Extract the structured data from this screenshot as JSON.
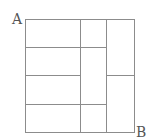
{
  "diagram": {
    "type": "grid-path",
    "labels": {
      "start": "A",
      "end": "B"
    },
    "colors": {
      "line": "#8c8c8c",
      "label": "#555555",
      "background": "#ffffff"
    },
    "outer_rect": {
      "x1": 25.5,
      "y1": 19.5,
      "x2": 134.5,
      "y2": 132.5
    },
    "vertical_lines": [
      {
        "x": 80.5,
        "y1": 19.5,
        "y2": 132.5
      },
      {
        "x": 106.5,
        "y1": 19.5,
        "y2": 132.5
      }
    ],
    "horizontal_lines": [
      {
        "y": 47.5,
        "x1": 25.5,
        "x2": 106.5
      },
      {
        "y": 75.5,
        "x1": 25.5,
        "x2": 80.5
      },
      {
        "y": 75.5,
        "x1": 106.5,
        "x2": 134.5
      },
      {
        "y": 104.5,
        "x1": 25.5,
        "x2": 106.5
      }
    ]
  }
}
